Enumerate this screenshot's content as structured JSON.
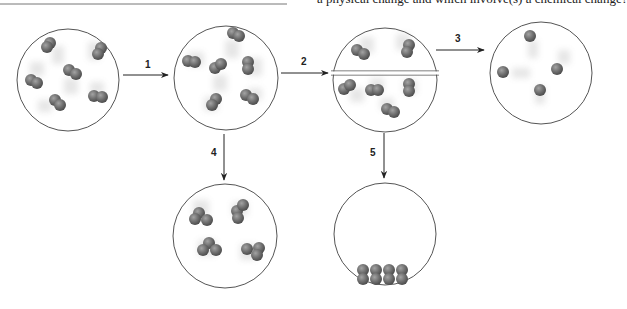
{
  "header": {
    "question_text": "a physical change and which involve(s) a chemical change?"
  },
  "diagram": {
    "arrows": [
      {
        "id": "1",
        "label": "1",
        "from": "initial-state",
        "to": "state-after-1"
      },
      {
        "id": "2",
        "label": "2",
        "from": "state-after-1",
        "to": "state-after-2"
      },
      {
        "id": "3",
        "label": "3",
        "from": "state-after-2",
        "to": "state-after-3"
      },
      {
        "id": "4",
        "label": "4",
        "from": "state-after-1",
        "to": "state-after-4"
      },
      {
        "id": "5",
        "label": "5",
        "from": "state-after-2",
        "to": "state-after-5"
      }
    ],
    "states": [
      {
        "id": "initial-state",
        "description": "six diatomic molecules moving freely"
      },
      {
        "id": "state-after-1",
        "description": "six diatomic molecules, moving freely"
      },
      {
        "id": "state-after-2",
        "description": "container divided; 2 molecules top, 4 bottom"
      },
      {
        "id": "state-after-3",
        "description": "four single atoms"
      },
      {
        "id": "state-after-4",
        "description": "four triatomic molecules"
      },
      {
        "id": "state-after-5",
        "description": "eight atoms packed at the bottom (condensed)"
      }
    ],
    "colors": {
      "outline": "#555555",
      "atom": "#6b6b6b",
      "atom_highlight": "#9a9a9a",
      "arrow": "#222222"
    }
  }
}
